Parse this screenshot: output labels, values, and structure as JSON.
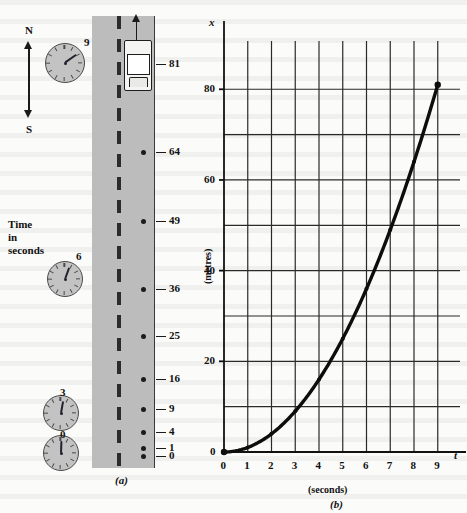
{
  "figure": {
    "panel_a_caption": "(a)",
    "panel_b_caption": "(b)"
  },
  "panel_a": {
    "compass": {
      "north_label": "N",
      "south_label": "S",
      "icon": "compass-arrow-icon"
    },
    "time_label_lines": [
      "Time",
      "in",
      "seconds"
    ],
    "car_label": "81",
    "clocks": [
      {
        "time_label": "9",
        "hand_angle_deg": 55,
        "cx": 64,
        "cy": 62,
        "r": 19,
        "num_x": 84,
        "num_y": 36
      },
      {
        "time_label": "6",
        "hand_angle_deg": 20,
        "cx": 64,
        "cy": 278,
        "r": 17,
        "num_x": 76,
        "num_y": 250
      },
      {
        "time_label": "3",
        "hand_angle_deg": 10,
        "cx": 60,
        "cy": 412,
        "r": 17,
        "num_x": 60,
        "num_y": 386
      },
      {
        "time_label": "0",
        "hand_angle_deg": 2,
        "cx": 60,
        "cy": 452,
        "r": 17,
        "num_x": 60,
        "num_y": 428
      }
    ],
    "position_markers": [
      {
        "time_s": 9,
        "distance_m": "81",
        "y": 64
      },
      {
        "time_s": 8,
        "distance_m": "64",
        "y": 152
      },
      {
        "time_s": 7,
        "distance_m": "49",
        "y": 221
      },
      {
        "time_s": 6,
        "distance_m": "36",
        "y": 289
      },
      {
        "time_s": 5,
        "distance_m": "25",
        "y": 336
      },
      {
        "time_s": 4,
        "distance_m": "16",
        "y": 379
      },
      {
        "time_s": 3,
        "distance_m": "9",
        "y": 409
      },
      {
        "time_s": 2,
        "distance_m": "4",
        "y": 432
      },
      {
        "time_s": 1,
        "distance_m": "1",
        "y": 448
      },
      {
        "time_s": 0,
        "distance_m": "0",
        "y": 456
      }
    ]
  },
  "chart_data": {
    "type": "line",
    "title": "",
    "xlabel": "t",
    "xunits": "(seconds)",
    "ylabel": "x",
    "yunits": "(metres)",
    "xlim": [
      0,
      9.6
    ],
    "ylim": [
      0,
      88
    ],
    "grid": true,
    "x_major_ticks": [
      0,
      1,
      2,
      3,
      4,
      5,
      6,
      7,
      8,
      9
    ],
    "x_tick_labels": [
      "0",
      "1",
      "2",
      "3",
      "4",
      "5",
      "6",
      "7",
      "8",
      "9"
    ],
    "y_gridlines": [
      0,
      10,
      20,
      30,
      40,
      50,
      60,
      70,
      80
    ],
    "y_major_ticks": [
      0,
      20,
      40,
      60,
      80
    ],
    "y_tick_labels": [
      "0",
      "20",
      "40",
      "60",
      "80"
    ],
    "series": [
      {
        "name": "distance",
        "marker": "dot",
        "x": [
          0,
          1,
          2,
          3,
          4,
          5,
          6,
          7,
          8,
          9
        ],
        "values": [
          0,
          1,
          4,
          9,
          16,
          25,
          36,
          49,
          64,
          81
        ]
      }
    ]
  }
}
